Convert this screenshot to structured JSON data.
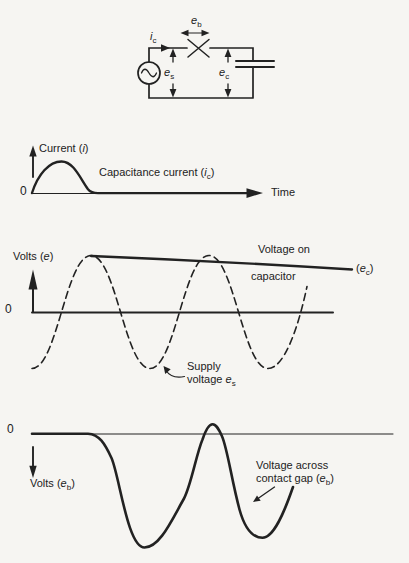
{
  "colors": {
    "ink": "#222222",
    "paper": "#f6f5f2"
  },
  "circuit": {
    "branch_current": {
      "var": "i",
      "sub": "c"
    },
    "gap_voltage": {
      "var": "e",
      "sub": "b"
    },
    "supply_voltage": {
      "var": "e",
      "sub": "s"
    },
    "capacitor_voltage": {
      "var": "e",
      "sub": "c"
    }
  },
  "current_graph": {
    "zero": "0",
    "axis_label": {
      "pre": "Current (",
      "var": "i",
      "post": ")"
    },
    "curve_label": {
      "pre": "Capacitance current (",
      "var": "i",
      "sub": "c",
      "post": ")"
    },
    "time_label": "Time"
  },
  "voltage_graph": {
    "zero": "0",
    "axis_label": {
      "pre": "Volts (",
      "var": "e",
      "post": ")"
    },
    "capacitor_line1": "Voltage on",
    "capacitor_line2": "capacitor",
    "capacitor_tag": {
      "pre": "(",
      "var": "e",
      "sub": "c",
      "post": ")"
    },
    "supply_line1": "Supply",
    "supply_line2": {
      "pre": "voltage ",
      "var": "e",
      "sub": "s"
    }
  },
  "gap_graph": {
    "zero": "0",
    "axis_label": {
      "pre": "Volts (",
      "var": "e",
      "sub": "b",
      "post": ")"
    },
    "curve_line1": "Voltage across",
    "curve_line2": {
      "pre": "contact gap (",
      "var": "e",
      "sub": "b",
      "post": ")"
    }
  }
}
